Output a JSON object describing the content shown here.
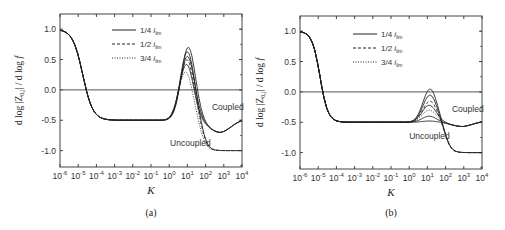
{
  "chart_data": [
    {
      "panel": "a",
      "type": "line",
      "caption": "(a)",
      "xlabel": "K",
      "ylabel": "d log |Z0,j| / d log f",
      "xscale": "log",
      "xlim": [
        1e-06,
        10000.0
      ],
      "ylim": [
        -1.27,
        1.25
      ],
      "xticks": [
        "10^-6",
        "10^-5",
        "10^-4",
        "10^-3",
        "10^-2",
        "10^-1",
        "10^0",
        "10^1",
        "10^2",
        "10^3",
        "10^4"
      ],
      "yticks": [
        1.0,
        0.5,
        0.0,
        -0.5,
        -1.0
      ],
      "ytick_labels": [
        "1.0",
        "0.5",
        "0.0",
        "-0.5",
        "-1.0"
      ],
      "grid": false,
      "hline": 0.0,
      "legend": [
        {
          "label": "1/4",
          "sub": "lim",
          "style": "solid"
        },
        {
          "label": "1/2",
          "sub": "lim",
          "style": "dashed"
        },
        {
          "label": "3/4",
          "sub": "lim",
          "style": "dotted"
        }
      ],
      "annotations": [
        {
          "text": "Coupled",
          "x_log": 2.35,
          "y": -0.33
        },
        {
          "text": "Uncoupled",
          "x_log": 0.05,
          "y": -0.92
        }
      ],
      "common": {
        "drop_center_log": -4.75,
        "drop_width": 0.28,
        "plateau": -0.5
      },
      "series": [
        {
          "name": "1/4 i_lim coupled",
          "style": "solid",
          "peak": 0.7,
          "peak_log": 1.05,
          "tail": "coupled"
        },
        {
          "name": "1/4 i_lim uncoupled",
          "style": "solid",
          "peak": 0.63,
          "peak_log": 1.0,
          "tail": "uncoupled"
        },
        {
          "name": "1/2 i_lim coupled",
          "style": "solid",
          "peak": 0.55,
          "peak_log": 1.0,
          "tail": "coupled"
        },
        {
          "name": "1/2 i_lim uncoupled",
          "style": "dashed",
          "peak": 0.5,
          "peak_log": 0.98,
          "tail": "uncoupled"
        },
        {
          "name": "3/4 i_lim coupled",
          "style": "solid",
          "peak": 0.42,
          "peak_log": 0.95,
          "tail": "coupled"
        },
        {
          "name": "3/4 i_lim uncoupled",
          "style": "dotted",
          "peak": 0.3,
          "peak_log": 0.9,
          "tail": "uncoupled"
        }
      ],
      "tails": {
        "coupled": {
          "min": -0.7,
          "min_log": 2.8,
          "end": -0.52
        },
        "uncoupled": {
          "end": -1.0
        }
      }
    },
    {
      "panel": "b",
      "type": "line",
      "caption": "(b)",
      "xlabel": "K",
      "ylabel": "d log |Z0,j| / d log f",
      "xscale": "log",
      "xlim": [
        1e-06,
        10000.0
      ],
      "ylim": [
        -1.27,
        1.25
      ],
      "xticks": [
        "10^-6",
        "10^-5",
        "10^-4",
        "10^-3",
        "10^-2",
        "10^-1",
        "10^0",
        "10^1",
        "10^2",
        "10^3",
        "10^4"
      ],
      "yticks": [
        1.0,
        0.5,
        0.0,
        -0.5,
        -1.0
      ],
      "ytick_labels": [
        "1.0",
        "0.5",
        "0.0",
        "-0.5",
        "-1.0"
      ],
      "grid": false,
      "hline": 0.0,
      "legend": [
        {
          "label": "1/4",
          "sub": "lim",
          "style": "solid"
        },
        {
          "label": "1/2",
          "sub": "lim",
          "style": "dashed"
        },
        {
          "label": "3/4",
          "sub": "lim",
          "style": "dotted"
        }
      ],
      "annotations": [
        {
          "text": "Coupled",
          "x_log": 2.35,
          "y": -0.33
        },
        {
          "text": "Uncoupled",
          "x_log": 0.0,
          "y": -0.78
        }
      ],
      "common": {
        "drop_center_log": -4.9,
        "drop_width": 0.22,
        "plateau": -0.5
      },
      "series": [
        {
          "name": "1/4 i_lim",
          "style": "solid",
          "peak": 0.05,
          "peak_log": 1.15,
          "tail": "uncoupled"
        },
        {
          "name": "1/4 i_lim b",
          "style": "solid",
          "peak": -0.05,
          "peak_log": 1.15,
          "tail": "uncoupled"
        },
        {
          "name": "1/2 i_lim",
          "style": "dashed",
          "peak": -0.15,
          "peak_log": 1.15,
          "tail": "uncoupled"
        },
        {
          "name": "1/2 i_lim coupled",
          "style": "solid",
          "peak": -0.22,
          "peak_log": 1.1,
          "tail": "coupled"
        },
        {
          "name": "3/4 i_lim",
          "style": "dotted",
          "peak": -0.3,
          "peak_log": 1.1,
          "tail": "coupled"
        },
        {
          "name": "3/4 i_lim coupled",
          "style": "solid",
          "peak": -0.4,
          "peak_log": 1.1,
          "tail": "coupled"
        },
        {
          "name": "flat",
          "style": "solid",
          "peak": -0.48,
          "peak_log": 1.1,
          "tail": "coupled"
        }
      ],
      "tails": {
        "coupled": {
          "min": -0.57,
          "min_log": 2.95,
          "end": -0.42
        },
        "uncoupled": {
          "end": -1.0
        }
      }
    }
  ]
}
